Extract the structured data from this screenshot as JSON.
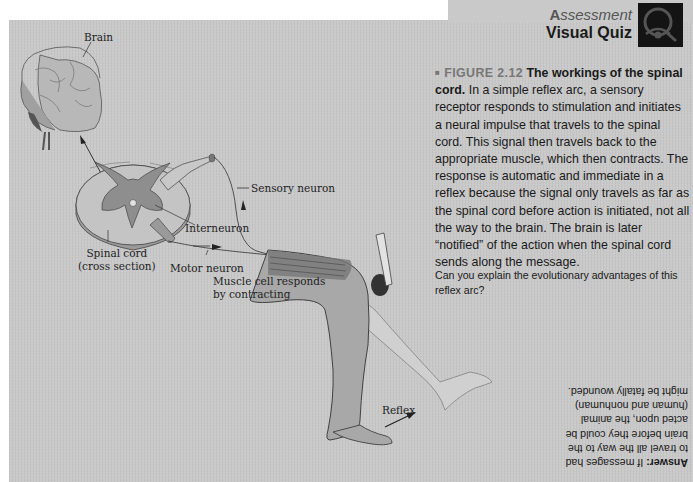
{
  "header": {
    "section_label": "Assessment",
    "section_label_initial": "A",
    "section_label_rest": "ssessment",
    "title": "Visual Quiz",
    "icon": "eye-in-q-icon"
  },
  "caption": {
    "figure_number": "FIGURE 2.12",
    "figure_title": "The workings of the spinal cord.",
    "body": "In a simple reflex arc, a sensory receptor responds to stimulation and initiates a neural impulse that travels to the spinal cord. This signal then travels back to the appropriate muscle, which then contracts. The response is automatic and immediate in a reflex because the signal only travels as far as the spinal cord before action is initiated, not all the way to the brain. The brain is later “notified” of the action when the spinal cord sends along the message."
  },
  "question": "Can you explain the evolutionary advantages of this reflex arc?",
  "answer": {
    "label": "Answer:",
    "text": "If messages had to travel all the way to the brain before they could be acted upon, the animal (human and nonhuman) might be fatally wounded."
  },
  "diagram": {
    "labels": {
      "brain": "Brain",
      "sensory_neuron": "Sensory neuron",
      "interneuron": "Interneuron",
      "spinal_cord_line1": "Spinal cord",
      "spinal_cord_line2": "(cross section)",
      "motor_neuron": "Motor neuron",
      "muscle_line1": "Muscle cell responds",
      "muscle_line2": "by contracting",
      "reflex": "Reflex"
    }
  },
  "colors": {
    "panel_bg": "#c9c9c9",
    "gray_matter": "#8e8e8e",
    "leg_fill": "#a8a8a8",
    "icon_bg": "#141414"
  }
}
